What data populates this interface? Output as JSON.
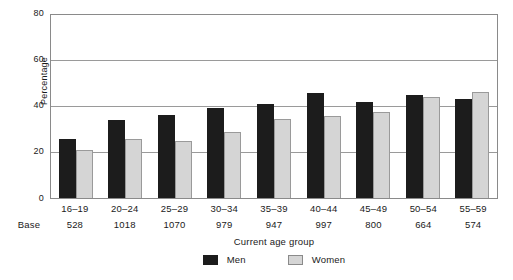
{
  "chart_data": {
    "type": "bar",
    "title": "",
    "xlabel": "Current age group",
    "ylabel": "Percentage",
    "ylim": [
      0,
      80
    ],
    "yticks": [
      0,
      20,
      40,
      60,
      80
    ],
    "grid": true,
    "legend_position": "bottom",
    "categories": [
      "16–19",
      "20–24",
      "25–29",
      "30–34",
      "35–39",
      "40–44",
      "45–49",
      "50–54",
      "55–59"
    ],
    "series": [
      {
        "name": "Men",
        "color": "#1c1c1c",
        "values": [
          26,
          34,
          36.5,
          39.5,
          41,
          46,
          42,
          45,
          43.5
        ]
      },
      {
        "name": "Women",
        "color": "#d5d5d5",
        "values": [
          21,
          26,
          25,
          29,
          34.5,
          36,
          37.5,
          44,
          46.5
        ]
      }
    ],
    "base_label": "Base",
    "base_values": [
      "528",
      "1018",
      "1070",
      "979",
      "947",
      "997",
      "800",
      "664",
      "574"
    ]
  }
}
